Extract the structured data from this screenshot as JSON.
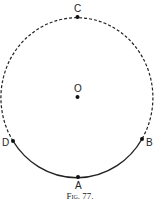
{
  "figure": {
    "caption": "Fig. 77.",
    "center": {
      "label": "O",
      "x": 77.5,
      "y": 97
    },
    "radius_x": 76,
    "radius_y": 80,
    "dashed_arc": "upper portion from D through C to B",
    "solid_arc": "lower portion from D through A to B",
    "points": [
      {
        "label": "C",
        "x": 77.5,
        "y": 17
      },
      {
        "label": "O",
        "x": 77.5,
        "y": 97
      },
      {
        "label": "D",
        "x": 13,
        "y": 141
      },
      {
        "label": "B",
        "x": 142,
        "y": 139
      },
      {
        "label": "A",
        "x": 78,
        "y": 177
      }
    ],
    "colors": {
      "stroke": "#222222",
      "background": "#ffffff"
    }
  }
}
